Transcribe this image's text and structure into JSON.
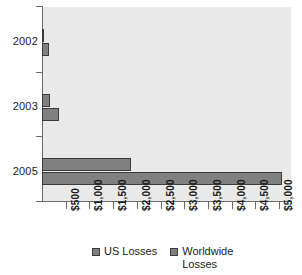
{
  "chart_data": {
    "type": "bar",
    "orientation": "horizontal",
    "title": "",
    "subtitle": "",
    "xlabel": "",
    "ylabel": "",
    "categories": [
      "2002",
      "2003",
      "2005"
    ],
    "series": [
      {
        "name": "US Losses",
        "values": [
          45,
          170,
          1880
        ],
        "color": "#808080"
      },
      {
        "name": "Worldwide Losses",
        "values": [
          145,
          360,
          5050
        ],
        "color": "#808080"
      }
    ],
    "xlim": [
      0,
      5250
    ],
    "xtick_values": [
      500,
      1000,
      1500,
      2000,
      2500,
      3000,
      3500,
      4000,
      4500,
      5000
    ],
    "xtick_labels": [
      "$500",
      "$1,000",
      "$1,500",
      "$2,000",
      "$2,500",
      "$3,000",
      "$3,500",
      "$4,000",
      "$4,500",
      "$5,000"
    ],
    "grid": false,
    "legend_position": "bottom",
    "plot_background": "#e9e9e9",
    "axis_color": "#6b6b6b",
    "bar_outline_color": "#3c3c3c"
  },
  "legend": {
    "items": [
      {
        "label": "US Losses"
      },
      {
        "label": "Worldwide Losses"
      }
    ]
  }
}
